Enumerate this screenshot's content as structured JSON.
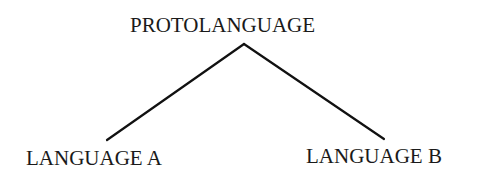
{
  "diagram": {
    "type": "tree",
    "root": {
      "label": "PROTOLANGUAGE"
    },
    "children": [
      {
        "label": "LANGUAGE A"
      },
      {
        "label": "LANGUAGE B"
      }
    ],
    "edges": [
      {
        "from": "PROTOLANGUAGE",
        "to": "LANGUAGE A"
      },
      {
        "from": "PROTOLANGUAGE",
        "to": "LANGUAGE B"
      }
    ],
    "line_color": "#111111"
  }
}
